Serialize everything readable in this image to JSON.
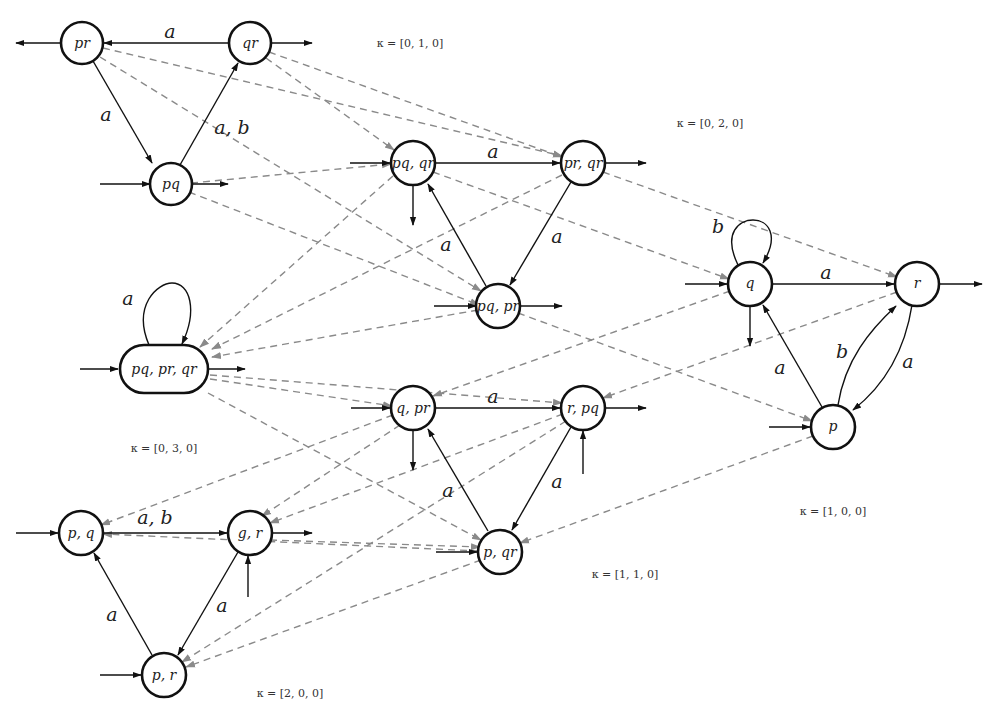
{
  "diagram": {
    "groups": [
      {
        "kappa": "κ = [0, 1, 0]",
        "kappa_pos": [
          410,
          47
        ],
        "nodes": [
          {
            "id": "pr",
            "label": "pr",
            "x": 82,
            "y": 43
          },
          {
            "id": "qr",
            "label": "qr",
            "x": 250,
            "y": 43
          },
          {
            "id": "pq",
            "label": "pq",
            "x": 171,
            "y": 183
          }
        ],
        "edges": [
          {
            "from": "qr",
            "to": "pr",
            "label": "a"
          },
          {
            "from": "pr",
            "to": "pq",
            "label": "a"
          },
          {
            "from": "pq",
            "to": "qr",
            "label": "a, b"
          }
        ]
      },
      {
        "kappa": "κ = [0, 2, 0]",
        "kappa_pos": [
          710,
          127
        ],
        "nodes": [
          {
            "id": "pq_qr",
            "label": "pq, qr",
            "x": 413,
            "y": 163
          },
          {
            "id": "pr_qr",
            "label": "pr, qr",
            "x": 583,
            "y": 163
          },
          {
            "id": "pq_pr",
            "label": "pq, pr",
            "x": 498,
            "y": 305
          }
        ],
        "edges": [
          {
            "from": "pq_qr",
            "to": "pr_qr",
            "label": "a"
          },
          {
            "from": "pr_qr",
            "to": "pq_pr",
            "label": "a"
          },
          {
            "from": "pq_pr",
            "to": "pq_qr",
            "label": "a"
          }
        ]
      },
      {
        "kappa": "κ = [0, 3, 0]",
        "kappa_pos": [
          164,
          452
        ],
        "nodes": [
          {
            "id": "pq_pr_qr",
            "label": "pq, pr, qr",
            "x": 164,
            "y": 369
          }
        ],
        "edges": [
          {
            "from": "pq_pr_qr",
            "to": "pq_pr_qr",
            "label": "a"
          }
        ]
      },
      {
        "kappa": "κ = [1, 0, 0]",
        "kappa_pos": [
          833,
          515
        ],
        "nodes": [
          {
            "id": "q",
            "label": "q",
            "x": 750,
            "y": 284
          },
          {
            "id": "r",
            "label": "r",
            "x": 917,
            "y": 284
          },
          {
            "id": "p",
            "label": "p",
            "x": 833,
            "y": 426
          }
        ],
        "edges": [
          {
            "from": "q",
            "to": "q",
            "label": "b"
          },
          {
            "from": "q",
            "to": "r",
            "label": "a"
          },
          {
            "from": "p",
            "to": "q",
            "label": "a"
          },
          {
            "from": "p",
            "to": "r",
            "label": "b"
          },
          {
            "from": "r",
            "to": "p",
            "label": "a"
          }
        ]
      },
      {
        "kappa": "κ = [1, 1, 0]",
        "kappa_pos": [
          625,
          578
        ],
        "nodes": [
          {
            "id": "q_pr",
            "label": "q, pr",
            "x": 413,
            "y": 408
          },
          {
            "id": "r_pq",
            "label": "r, pq",
            "x": 583,
            "y": 408
          },
          {
            "id": "p_qr",
            "label": "p, qr",
            "x": 500,
            "y": 550
          }
        ],
        "edges": [
          {
            "from": "q_pr",
            "to": "r_pq",
            "label": "a"
          },
          {
            "from": "r_pq",
            "to": "p_qr",
            "label": "a"
          },
          {
            "from": "p_qr",
            "to": "q_pr",
            "label": "a"
          }
        ]
      },
      {
        "kappa": "κ = [2, 0, 0]",
        "kappa_pos": [
          290,
          697
        ],
        "nodes": [
          {
            "id": "p_q",
            "label": "p, q",
            "x": 81,
            "y": 533
          },
          {
            "id": "g_r",
            "label": "g, r",
            "x": 250,
            "y": 533
          },
          {
            "id": "p_r",
            "label": "p, r",
            "x": 164,
            "y": 674
          }
        ],
        "edges": [
          {
            "from": "p_q",
            "to": "g_r",
            "label": "a, b"
          },
          {
            "from": "g_r",
            "to": "p_r",
            "label": "a"
          },
          {
            "from": "p_r",
            "to": "p_q",
            "label": "a"
          }
        ]
      }
    ]
  }
}
